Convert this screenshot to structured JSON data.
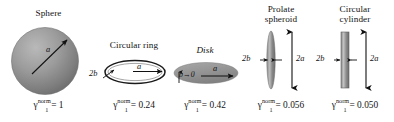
{
  "figure": {
    "background": "#ffffff",
    "ink": "#131313",
    "shape_fill": "#9a9a9a",
    "shape_dark": "#6a6a6a",
    "shape_light": "#cfcfcf"
  },
  "panels": [
    {
      "id": "sphere",
      "title": "Sphere",
      "title_italic": false,
      "shape": "sphere",
      "dimension_labels": [
        {
          "name": "radius-a",
          "text": "a"
        }
      ],
      "formula": {
        "symbol": "γ",
        "subscript": "1",
        "superscript": "norm",
        "equals": "=",
        "value": "1"
      }
    },
    {
      "id": "circular-ring",
      "title": "Circular ring",
      "title_italic": false,
      "shape": "ring",
      "dimension_labels": [
        {
          "name": "thickness-2b",
          "text": "2b"
        },
        {
          "name": "radius-a",
          "text": "a"
        }
      ],
      "formula": {
        "symbol": "γ",
        "subscript": "1",
        "superscript": "norm",
        "equals": "=",
        "value": "0.24"
      }
    },
    {
      "id": "disk",
      "title": "Disk",
      "title_italic": true,
      "shape": "disk",
      "dimension_labels": [
        {
          "name": "thickness-b-to-zero",
          "text": "b→0"
        },
        {
          "name": "radius-a",
          "text": "a"
        }
      ],
      "formula": {
        "symbol": "γ",
        "subscript": "1",
        "superscript": "norm",
        "equals": "=",
        "value": "0.42"
      }
    },
    {
      "id": "prolate-spheroid",
      "title": "Prolate\nspheroid",
      "title_line1": "Prolate",
      "title_line2": "spheroid",
      "title_italic": false,
      "shape": "prolate-spheroid",
      "dimension_labels": [
        {
          "name": "width-2b",
          "text": "2b"
        },
        {
          "name": "length-2a",
          "text": "2a"
        }
      ],
      "formula": {
        "symbol": "γ",
        "subscript": "1",
        "superscript": "norm",
        "equals": "=",
        "value": "0.056"
      }
    },
    {
      "id": "circular-cylinder",
      "title": "Circular\ncylinder",
      "title_line1": "Circular",
      "title_line2": "cylinder",
      "title_italic": false,
      "shape": "cylinder",
      "dimension_labels": [
        {
          "name": "width-2b",
          "text": "2b"
        },
        {
          "name": "length-2a",
          "text": "2a"
        }
      ],
      "formula": {
        "symbol": "γ",
        "subscript": "1",
        "superscript": "norm",
        "equals": "=",
        "value": "0.050"
      }
    }
  ]
}
